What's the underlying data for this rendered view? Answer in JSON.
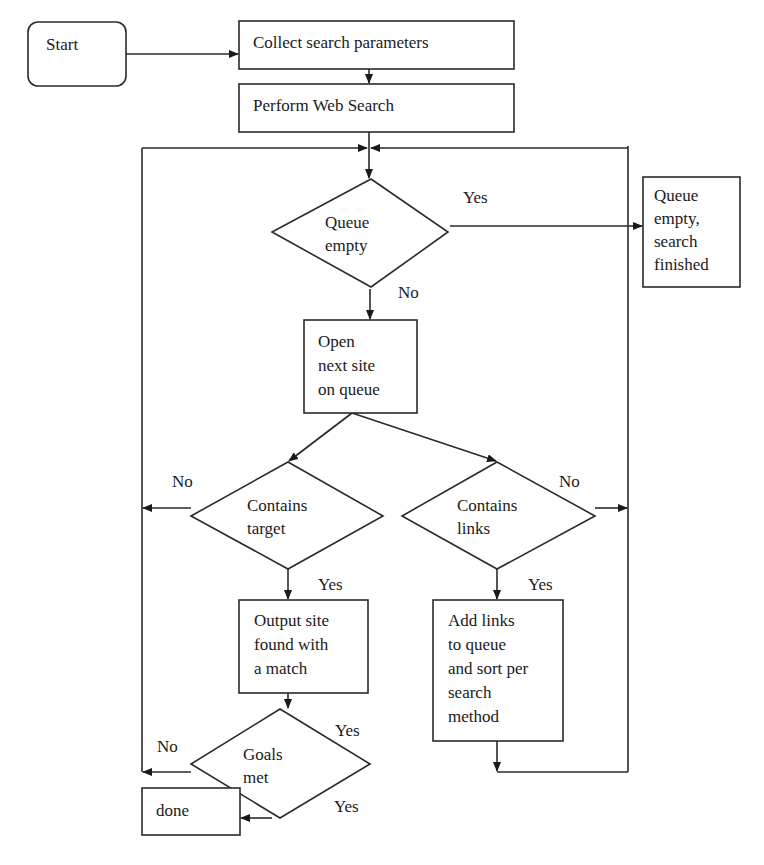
{
  "diagram": {
    "type": "flowchart",
    "nodes": {
      "start": {
        "shape": "rounded-rect",
        "lines": [
          "Start"
        ]
      },
      "collect": {
        "shape": "rect",
        "lines": [
          "Collect search parameters"
        ]
      },
      "perform": {
        "shape": "rect",
        "lines": [
          "Perform Web Search"
        ]
      },
      "queue_empty": {
        "shape": "diamond",
        "lines": [
          "Queue",
          "empty"
        ]
      },
      "finished": {
        "shape": "rect",
        "lines": [
          "Queue",
          "empty,",
          "search",
          "finished"
        ]
      },
      "open_next": {
        "shape": "rect",
        "lines": [
          "Open",
          "next site",
          "on queue"
        ]
      },
      "contains_target": {
        "shape": "diamond",
        "lines": [
          "Contains",
          "target"
        ]
      },
      "contains_links": {
        "shape": "diamond",
        "lines": [
          "Contains",
          "links"
        ]
      },
      "output_site": {
        "shape": "rect",
        "lines": [
          "Output site",
          "found with",
          "a match"
        ]
      },
      "add_links": {
        "shape": "rect",
        "lines": [
          "Add links",
          "to queue",
          "and sort per",
          "search",
          "method"
        ]
      },
      "goals_met": {
        "shape": "diamond",
        "lines": [
          "Goals",
          "met"
        ]
      },
      "done": {
        "shape": "rect",
        "lines": [
          "done"
        ]
      }
    },
    "edge_labels": {
      "queue_yes": "Yes",
      "queue_no": "No",
      "target_no": "No",
      "target_yes": "Yes",
      "links_no": "No",
      "links_yes": "Yes",
      "goals_yes_top": "Yes",
      "goals_no": "No",
      "goals_yes_bottom": "Yes"
    },
    "edges": [
      {
        "from": "start",
        "to": "collect"
      },
      {
        "from": "collect",
        "to": "perform"
      },
      {
        "from": "perform",
        "to": "queue_empty"
      },
      {
        "from": "queue_empty",
        "to": "finished",
        "label": "Yes"
      },
      {
        "from": "queue_empty",
        "to": "open_next",
        "label": "No"
      },
      {
        "from": "open_next",
        "to": "contains_target"
      },
      {
        "from": "open_next",
        "to": "contains_links"
      },
      {
        "from": "contains_target",
        "to": "queue_empty",
        "label": "No",
        "via": "left loop"
      },
      {
        "from": "contains_target",
        "to": "output_site",
        "label": "Yes"
      },
      {
        "from": "contains_links",
        "to": "queue_empty",
        "label": "No",
        "via": "right loop"
      },
      {
        "from": "contains_links",
        "to": "add_links",
        "label": "Yes"
      },
      {
        "from": "add_links",
        "to": "queue_empty",
        "via": "right loop"
      },
      {
        "from": "output_site",
        "to": "goals_met"
      },
      {
        "from": "goals_met",
        "to": "queue_empty",
        "label": "No",
        "via": "left loop"
      },
      {
        "from": "goals_met",
        "to": "done",
        "label": "Yes"
      }
    ]
  }
}
